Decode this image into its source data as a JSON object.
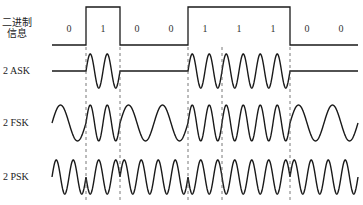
{
  "diagram": {
    "bits": [
      "0",
      "1",
      "0",
      "0",
      "1",
      "1",
      "1",
      "0",
      "0"
    ],
    "row_labels": {
      "binary_line1": "二进制",
      "binary_line2": "信息",
      "ask": "2 ASK",
      "fsk": "2 FSK",
      "psk": "2 PSK"
    },
    "layout": {
      "x_start": 52,
      "bit_width": 34.0,
      "binary_low_y": 45,
      "binary_high_y": 7,
      "ask_center_y": 71,
      "ask_amplitude": 17,
      "fsk_center_y": 123,
      "fsk_amplitude": 18,
      "psk_center_y": 177,
      "psk_amplitude": 17,
      "dash_top_y": 47,
      "dash_bottom_y": 200
    },
    "colors": {
      "stroke": "#1a1a1a",
      "dash": "#555555",
      "background": "#ffffff"
    },
    "carrier": {
      "ask_cycles_per_bit": 2,
      "fsk_cycles_per_bit_one": 2,
      "fsk_cycles_per_bit_zero": 1,
      "psk_cycles_per_bit": 2
    }
  }
}
